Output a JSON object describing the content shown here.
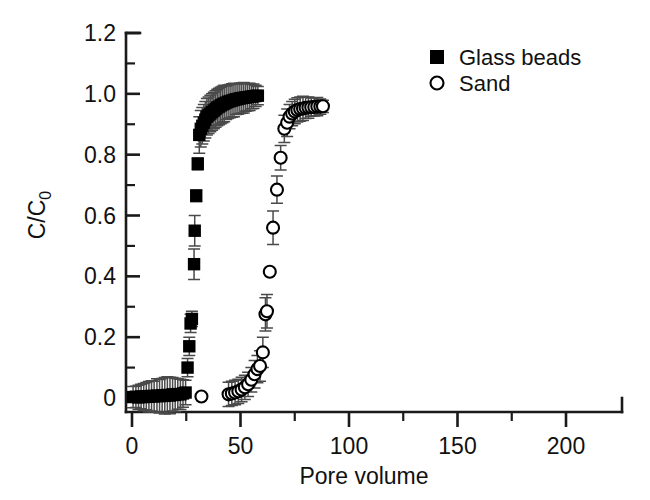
{
  "chart_data": {
    "type": "scatter",
    "title": "",
    "xlabel": "Pore volume",
    "ylabel": "C/C0",
    "ylabel_main": "C/C",
    "ylabel_sub": "0",
    "xlim": [
      -8,
      225
    ],
    "ylim": [
      -0.07,
      1.2
    ],
    "xticks": [
      0,
      50,
      100,
      150,
      200
    ],
    "xtick_labels": [
      "0",
      "50",
      "100",
      "150",
      "200"
    ],
    "xtick_minor_step": 25,
    "yticks": [
      0,
      0.2,
      0.4,
      0.6,
      0.8,
      1.0,
      1.2
    ],
    "ytick_labels": [
      "0",
      "0.2",
      "0.4",
      "0.6",
      "0.8",
      "1.0",
      "1.2"
    ],
    "ytick_minor_step": 0.1,
    "grid": false,
    "legend_position": "top-right",
    "error_bars": "symmetric-y-and-x",
    "series": [
      {
        "name": "Glass beads",
        "marker": "filled-square",
        "color": "#000000",
        "points": [
          {
            "x": 0.5,
            "y": 0.003,
            "yerr": 0.035
          },
          {
            "x": 1.8,
            "y": 0.004,
            "yerr": 0.035
          },
          {
            "x": 3.0,
            "y": 0.002,
            "yerr": 0.04
          },
          {
            "x": 4.2,
            "y": 0.005,
            "yerr": 0.04
          },
          {
            "x": 5.4,
            "y": 0.003,
            "yerr": 0.045
          },
          {
            "x": 6.6,
            "y": 0.006,
            "yerr": 0.045
          },
          {
            "x": 7.8,
            "y": 0.004,
            "yerr": 0.05
          },
          {
            "x": 9.0,
            "y": 0.007,
            "yerr": 0.05
          },
          {
            "x": 10.2,
            "y": 0.005,
            "yerr": 0.05
          },
          {
            "x": 11.5,
            "y": 0.008,
            "yerr": 0.055
          },
          {
            "x": 12.7,
            "y": 0.006,
            "yerr": 0.055
          },
          {
            "x": 13.9,
            "y": 0.009,
            "yerr": 0.055
          },
          {
            "x": 15.1,
            "y": 0.007,
            "yerr": 0.06
          },
          {
            "x": 16.3,
            "y": 0.01,
            "yerr": 0.06
          },
          {
            "x": 17.5,
            "y": 0.008,
            "yerr": 0.06
          },
          {
            "x": 18.7,
            "y": 0.012,
            "yerr": 0.055
          },
          {
            "x": 19.9,
            "y": 0.01,
            "yerr": 0.055
          },
          {
            "x": 21.1,
            "y": 0.013,
            "yerr": 0.05
          },
          {
            "x": 22.3,
            "y": 0.012,
            "yerr": 0.05
          },
          {
            "x": 23.5,
            "y": 0.015,
            "yerr": 0.045
          },
          {
            "x": 24.7,
            "y": 0.018,
            "yerr": 0.04
          },
          {
            "x": 25.6,
            "y": 0.1,
            "yerr": 0.03
          },
          {
            "x": 26.4,
            "y": 0.17,
            "yerr": 0.03
          },
          {
            "x": 27.0,
            "y": 0.245,
            "yerr": 0.03
          },
          {
            "x": 27.6,
            "y": 0.26,
            "yerr": 0.025
          },
          {
            "x": 28.6,
            "y": 0.44,
            "yerr": 0.05
          },
          {
            "x": 28.9,
            "y": 0.55,
            "yerr": 0.05
          },
          {
            "x": 29.6,
            "y": 0.665,
            "yerr": 0.02
          },
          {
            "x": 30.3,
            "y": 0.77,
            "yerr": 0.02
          },
          {
            "x": 31.0,
            "y": 0.865,
            "yerr": 0.06
          },
          {
            "x": 31.7,
            "y": 0.885,
            "yerr": 0.06
          },
          {
            "x": 32.4,
            "y": 0.895,
            "yerr": 0.06
          },
          {
            "x": 33.1,
            "y": 0.905,
            "yerr": 0.06
          },
          {
            "x": 33.8,
            "y": 0.915,
            "yerr": 0.06
          },
          {
            "x": 34.5,
            "y": 0.925,
            "yerr": 0.06
          },
          {
            "x": 35.3,
            "y": 0.93,
            "yerr": 0.06
          },
          {
            "x": 36.1,
            "y": 0.935,
            "yerr": 0.06
          },
          {
            "x": 36.9,
            "y": 0.94,
            "yerr": 0.06
          },
          {
            "x": 37.7,
            "y": 0.945,
            "yerr": 0.06
          },
          {
            "x": 38.5,
            "y": 0.95,
            "yerr": 0.06
          },
          {
            "x": 39.3,
            "y": 0.955,
            "yerr": 0.06
          },
          {
            "x": 40.1,
            "y": 0.958,
            "yerr": 0.06
          },
          {
            "x": 40.9,
            "y": 0.962,
            "yerr": 0.06
          },
          {
            "x": 41.7,
            "y": 0.965,
            "yerr": 0.06
          },
          {
            "x": 42.5,
            "y": 0.968,
            "yerr": 0.06
          },
          {
            "x": 43.4,
            "y": 0.971,
            "yerr": 0.055
          },
          {
            "x": 44.3,
            "y": 0.974,
            "yerr": 0.055
          },
          {
            "x": 45.2,
            "y": 0.976,
            "yerr": 0.055
          },
          {
            "x": 46.1,
            "y": 0.978,
            "yerr": 0.055
          },
          {
            "x": 47.0,
            "y": 0.98,
            "yerr": 0.055
          },
          {
            "x": 47.9,
            "y": 0.982,
            "yerr": 0.05
          },
          {
            "x": 48.8,
            "y": 0.983,
            "yerr": 0.05
          },
          {
            "x": 49.7,
            "y": 0.985,
            "yerr": 0.05
          },
          {
            "x": 50.6,
            "y": 0.986,
            "yerr": 0.05
          },
          {
            "x": 51.5,
            "y": 0.987,
            "yerr": 0.05
          },
          {
            "x": 52.4,
            "y": 0.988,
            "yerr": 0.045
          },
          {
            "x": 53.3,
            "y": 0.989,
            "yerr": 0.045
          },
          {
            "x": 54.2,
            "y": 0.99,
            "yerr": 0.045
          },
          {
            "x": 55.1,
            "y": 0.991,
            "yerr": 0.04
          },
          {
            "x": 56.0,
            "y": 0.992,
            "yerr": 0.04
          },
          {
            "x": 57.0,
            "y": 0.993,
            "yerr": 0.035
          },
          {
            "x": 58.0,
            "y": 0.994,
            "yerr": 0.03
          }
        ]
      },
      {
        "name": "Sand",
        "marker": "open-circle",
        "color": "#000000",
        "points": [
          {
            "x": 32.0,
            "y": 0.005,
            "yerr": 0.0
          },
          {
            "x": 44.5,
            "y": 0.012,
            "yerr": 0.04
          },
          {
            "x": 46.0,
            "y": 0.015,
            "yerr": 0.04
          },
          {
            "x": 47.5,
            "y": 0.018,
            "yerr": 0.04
          },
          {
            "x": 49.0,
            "y": 0.022,
            "yerr": 0.04
          },
          {
            "x": 50.5,
            "y": 0.028,
            "yerr": 0.04
          },
          {
            "x": 52.0,
            "y": 0.035,
            "yerr": 0.04
          },
          {
            "x": 53.5,
            "y": 0.045,
            "yerr": 0.04
          },
          {
            "x": 55.0,
            "y": 0.06,
            "yerr": 0.04
          },
          {
            "x": 56.5,
            "y": 0.078,
            "yerr": 0.045
          },
          {
            "x": 57.8,
            "y": 0.095,
            "yerr": 0.045
          },
          {
            "x": 59.0,
            "y": 0.105,
            "yerr": 0.05
          },
          {
            "x": 60.3,
            "y": 0.15,
            "yerr": 0.05
          },
          {
            "x": 61.5,
            "y": 0.275,
            "yerr": 0.055
          },
          {
            "x": 62.2,
            "y": 0.285,
            "yerr": 0.055
          },
          {
            "x": 63.5,
            "y": 0.415,
            "yerr": 0.0
          },
          {
            "x": 65.0,
            "y": 0.56,
            "yerr": 0.055
          },
          {
            "x": 66.8,
            "y": 0.685,
            "yerr": 0.045
          },
          {
            "x": 68.5,
            "y": 0.79,
            "yerr": 0.04
          },
          {
            "x": 70.2,
            "y": 0.885,
            "yerr": 0.045
          },
          {
            "x": 71.5,
            "y": 0.905,
            "yerr": 0.045
          },
          {
            "x": 72.6,
            "y": 0.925,
            "yerr": 0.04
          },
          {
            "x": 73.8,
            "y": 0.935,
            "yerr": 0.04
          },
          {
            "x": 75.0,
            "y": 0.942,
            "yerr": 0.04
          },
          {
            "x": 76.2,
            "y": 0.947,
            "yerr": 0.04
          },
          {
            "x": 77.5,
            "y": 0.95,
            "yerr": 0.04
          },
          {
            "x": 78.8,
            "y": 0.952,
            "yerr": 0.04
          },
          {
            "x": 80.0,
            "y": 0.954,
            "yerr": 0.035
          },
          {
            "x": 81.3,
            "y": 0.955,
            "yerr": 0.035
          },
          {
            "x": 82.6,
            "y": 0.956,
            "yerr": 0.03
          },
          {
            "x": 84.0,
            "y": 0.957,
            "yerr": 0.03
          },
          {
            "x": 85.4,
            "y": 0.958,
            "yerr": 0.03
          },
          {
            "x": 86.8,
            "y": 0.958,
            "yerr": 0.025
          },
          {
            "x": 88.0,
            "y": 0.959,
            "yerr": 0.02
          }
        ]
      }
    ]
  },
  "legend": {
    "items": [
      {
        "label": "Glass beads",
        "marker": "filled-square"
      },
      {
        "label": "Sand",
        "marker": "open-circle"
      }
    ]
  }
}
